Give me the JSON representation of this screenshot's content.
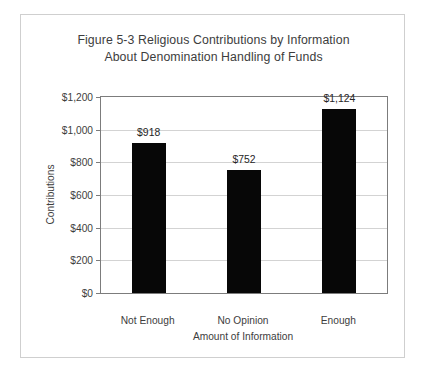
{
  "chart_data": {
    "type": "bar",
    "title": "Figure 5-3 Religious Contributions by Information About Denomination Handling of Funds",
    "title_lines": [
      "Figure 5-3 Religious Contributions by Information",
      "About Denomination Handling of Funds"
    ],
    "categories": [
      "Not Enough",
      "No Opinion",
      "Enough"
    ],
    "values": [
      918,
      752,
      1124
    ],
    "value_labels": [
      "$918",
      "$752",
      "$1,124"
    ],
    "xlabel": "Amount of Information",
    "ylabel": "Contributions",
    "ylim": [
      0,
      1200
    ],
    "ytick_values": [
      0,
      200,
      400,
      600,
      800,
      1000,
      1200
    ],
    "ytick_labels": [
      "$0",
      "$200",
      "$400",
      "$600",
      "$800",
      "$1,000",
      "$1,200"
    ],
    "grid": true,
    "legend": false,
    "bar_color": "#070707",
    "gridline_color": "#d3d3d3",
    "axis_color": "#7c7c7c",
    "text_color": "#3d3d3d",
    "border_color": "#cfcfcf",
    "background": "#ffffff"
  }
}
